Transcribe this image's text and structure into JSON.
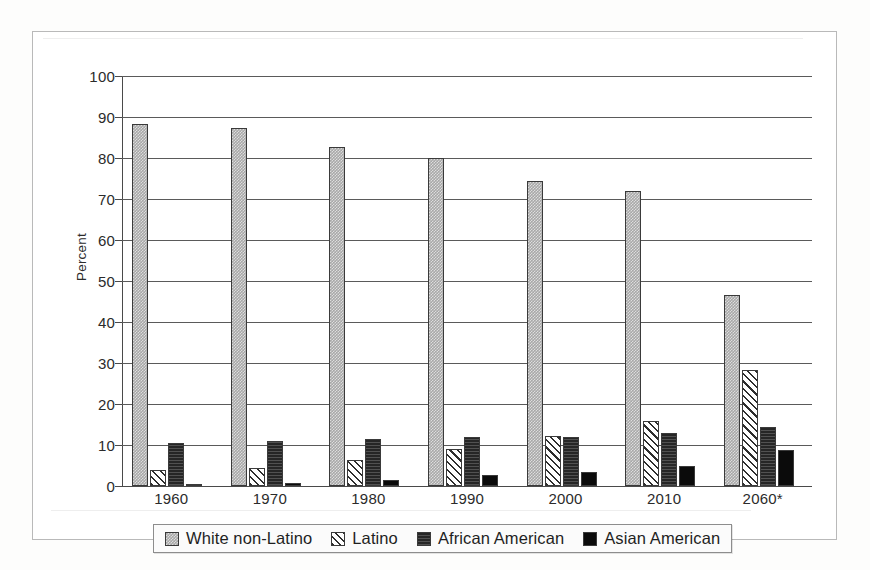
{
  "chart_data": {
    "type": "bar",
    "title": "",
    "xlabel": "",
    "ylabel": "Percent",
    "ylim": [
      0,
      100
    ],
    "ytick_step": 10,
    "yticks": [
      "100",
      "90",
      "80",
      "70",
      "60",
      "50",
      "40",
      "30",
      "20",
      "10",
      "0"
    ],
    "grid": true,
    "legend_position": "bottom",
    "categories": [
      "1960",
      "1970",
      "1980",
      "1990",
      "2000",
      "2010",
      "2060*"
    ],
    "series": [
      {
        "name": "White non-Latino",
        "swatch": "gray-stipple",
        "color": "#a8a8a8",
        "values": [
          88.4,
          87.2,
          82.6,
          80.0,
          74.5,
          71.9,
          46.6
        ]
      },
      {
        "name": "Latino",
        "swatch": "diagonal-hatch",
        "color": "#ffffff",
        "values": [
          3.9,
          4.5,
          6.3,
          9.0,
          12.1,
          15.8,
          28.2
        ]
      },
      {
        "name": "African American",
        "swatch": "dark-horizontal-texture",
        "color": "#262626",
        "values": [
          10.4,
          11.0,
          11.5,
          11.9,
          11.9,
          13.0,
          14.3
        ]
      },
      {
        "name": "Asian American",
        "swatch": "solid-black",
        "color": "#0b0b0b",
        "values": [
          0.6,
          0.8,
          1.5,
          2.8,
          3.5,
          4.9,
          8.8
        ]
      }
    ]
  },
  "legend": {
    "items": [
      {
        "label": "White non-Latino"
      },
      {
        "label": "Latino"
      },
      {
        "label": "African American"
      },
      {
        "label": "Asian American"
      }
    ]
  }
}
